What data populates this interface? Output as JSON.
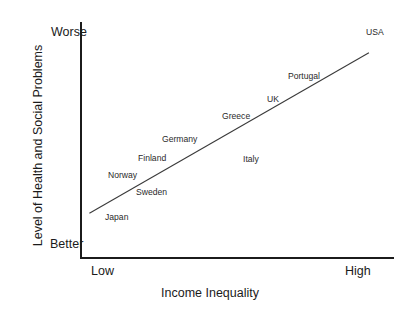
{
  "chart_data": {
    "type": "scatter",
    "title": "",
    "subtitle": "",
    "xlabel": "Income Inequality",
    "ylabel": "Level of Health and Social Problems",
    "x_tick_labels": [
      "Low",
      "High"
    ],
    "y_tick_labels": [
      "Better",
      "Worse"
    ],
    "xlim": [
      0,
      100
    ],
    "ylim": [
      0,
      100
    ],
    "grid": false,
    "legend": false,
    "axes_style": "two-spine L-shape, no tick marks, qualitative endpoints only",
    "annotation_note": "Country names are the data markers; no plotted dots are drawn",
    "points": [
      {
        "label": "Japan",
        "x": 9,
        "y": 17
      },
      {
        "label": "Norway",
        "x": 18,
        "y": 35
      },
      {
        "label": "Sweden",
        "x": 27,
        "y": 28
      },
      {
        "label": "Finland",
        "x": 28,
        "y": 42
      },
      {
        "label": "Germany",
        "x": 37,
        "y": 50
      },
      {
        "label": "Greece",
        "x": 58,
        "y": 60
      },
      {
        "label": "Italy",
        "x": 64,
        "y": 41
      },
      {
        "label": "UK",
        "x": 72,
        "y": 67
      },
      {
        "label": "Portugal",
        "x": 79,
        "y": 77
      },
      {
        "label": "USA",
        "x": 96,
        "y": 95
      }
    ],
    "trendline": {
      "name": "linear best fit",
      "x_start": 3,
      "y_start": 19,
      "x_end": 92,
      "y_end": 87,
      "color": "#3a3a3a",
      "width_px": 1
    },
    "colors": {
      "axis": "#1b1b1b",
      "text": "#1b1b1b",
      "point_label": "#2a2a2a",
      "trendline": "#3a3a3a",
      "background": "#ffffff"
    }
  },
  "axis": {
    "y_title": "Level of Health and Social Problems",
    "x_title": "Income Inequality",
    "y_top_label": "Worse",
    "y_bottom_label": "Better",
    "x_left_label": "Low",
    "x_right_label": "High"
  },
  "labels": {
    "japan": "Japan",
    "norway": "Norway",
    "sweden": "Sweden",
    "finland": "Finland",
    "germany": "Germany",
    "greece": "Greece",
    "italy": "Italy",
    "uk": "UK",
    "portugal": "Portugal",
    "usa": "USA"
  }
}
